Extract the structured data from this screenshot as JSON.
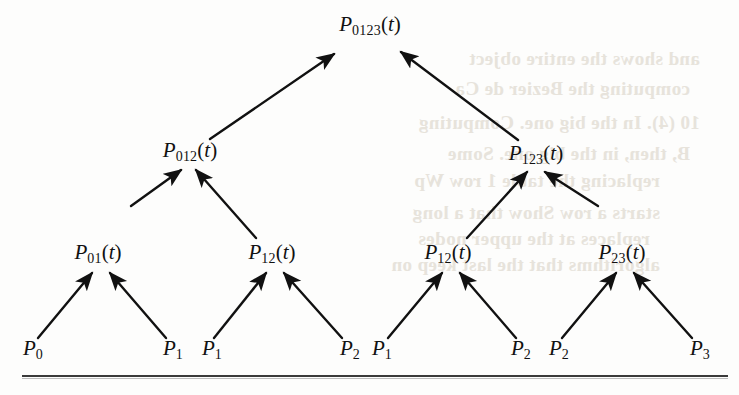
{
  "figure": {
    "type": "recursion-triangle-diagram",
    "ink_color": "#111111",
    "paper_color": "#fdfdfc",
    "bleed_color": "#e6e2da"
  },
  "nodes": {
    "root": {
      "base": "P",
      "sub": "0123",
      "arg": "(t)",
      "x": 370,
      "y": 26
    },
    "level3": [
      {
        "base": "P",
        "sub": "012",
        "arg": "(t)",
        "x": 190,
        "y": 152
      },
      {
        "base": "P",
        "sub": "123",
        "arg": "(t)",
        "x": 536,
        "y": 155
      }
    ],
    "level2": [
      {
        "base": "P",
        "sub": "01",
        "arg": "(t)",
        "x": 98,
        "y": 254
      },
      {
        "base": "P",
        "sub": "12",
        "arg": "(t)",
        "x": 272,
        "y": 254
      },
      {
        "base": "P",
        "sub": "12",
        "arg": "(t)",
        "x": 448,
        "y": 254
      },
      {
        "base": "P",
        "sub": "23",
        "arg": "(t)",
        "x": 622,
        "y": 254
      }
    ],
    "leaves": [
      {
        "base": "P",
        "sub": "0",
        "arg": "",
        "x": 33,
        "y": 350
      },
      {
        "base": "P",
        "sub": "1",
        "arg": "",
        "x": 173,
        "y": 350
      },
      {
        "base": "P",
        "sub": "1",
        "arg": "",
        "x": 212,
        "y": 350
      },
      {
        "base": "P",
        "sub": "2",
        "arg": "",
        "x": 350,
        "y": 350
      },
      {
        "base": "P",
        "sub": "1",
        "arg": "",
        "x": 382,
        "y": 350
      },
      {
        "base": "P",
        "sub": "2",
        "arg": "",
        "x": 521,
        "y": 350
      },
      {
        "base": "P",
        "sub": "2",
        "arg": "",
        "x": 559,
        "y": 350
      },
      {
        "base": "P",
        "sub": "3",
        "arg": "",
        "x": 700,
        "y": 350
      }
    ]
  },
  "arrows": [
    {
      "from": [
        210,
        139
      ],
      "to": [
        334,
        54
      ],
      "name": "arrow-p012-to-p0123"
    },
    {
      "from": [
        518,
        140
      ],
      "to": [
        401,
        52
      ],
      "name": "arrow-p123-to-p0123"
    },
    {
      "from": [
        131,
        206
      ],
      "to": [
        181,
        170
      ],
      "name": "arrow-p01-to-p012"
    },
    {
      "from": [
        256,
        238
      ],
      "to": [
        196,
        170
      ],
      "name": "arrow-p12a-to-p012"
    },
    {
      "from": [
        467,
        238
      ],
      "to": [
        527,
        172
      ],
      "name": "arrow-p12b-to-p123"
    },
    {
      "from": [
        598,
        206
      ],
      "to": [
        545,
        172
      ],
      "name": "arrow-p23-to-p123"
    },
    {
      "from": [
        38,
        338
      ],
      "to": [
        92,
        273
      ],
      "name": "arrow-p0-to-p01"
    },
    {
      "from": [
        166,
        338
      ],
      "to": [
        110,
        273
      ],
      "name": "arrow-p1-to-p01"
    },
    {
      "from": [
        214,
        338
      ],
      "to": [
        266,
        273
      ],
      "name": "arrow-p1-to-p12a"
    },
    {
      "from": [
        342,
        338
      ],
      "to": [
        284,
        273
      ],
      "name": "arrow-p2-to-p12a"
    },
    {
      "from": [
        388,
        338
      ],
      "to": [
        442,
        273
      ],
      "name": "arrow-p1-to-p12b"
    },
    {
      "from": [
        516,
        338
      ],
      "to": [
        460,
        273
      ],
      "name": "arrow-p2-to-p12b"
    },
    {
      "from": [
        562,
        338
      ],
      "to": [
        616,
        273
      ],
      "name": "arrow-p2-to-p23"
    },
    {
      "from": [
        692,
        338
      ],
      "to": [
        634,
        273
      ],
      "name": "arrow-p3-to-p23"
    }
  ],
  "bleed_text": [
    {
      "text": "and shows the entire object",
      "x": 700,
      "y": 48
    },
    {
      "text": "computing the Bezier de Ca",
      "x": 690,
      "y": 78
    },
    {
      "text": "10 (4). In the big one. Computing",
      "x": 700,
      "y": 112
    },
    {
      "text": "B, then, in the big one. Some",
      "x": 690,
      "y": 143
    },
    {
      "text": "replacing the table 1 row Wp",
      "x": 660,
      "y": 170
    },
    {
      "text": "starts a row Show that a long",
      "x": 660,
      "y": 202
    },
    {
      "text": "replaces at the upper nodes",
      "x": 650,
      "y": 228
    },
    {
      "text": "algorithms that the last keep on",
      "x": 660,
      "y": 254
    }
  ],
  "rule": {
    "present": true,
    "y": 375,
    "x": 22,
    "width": 706
  }
}
